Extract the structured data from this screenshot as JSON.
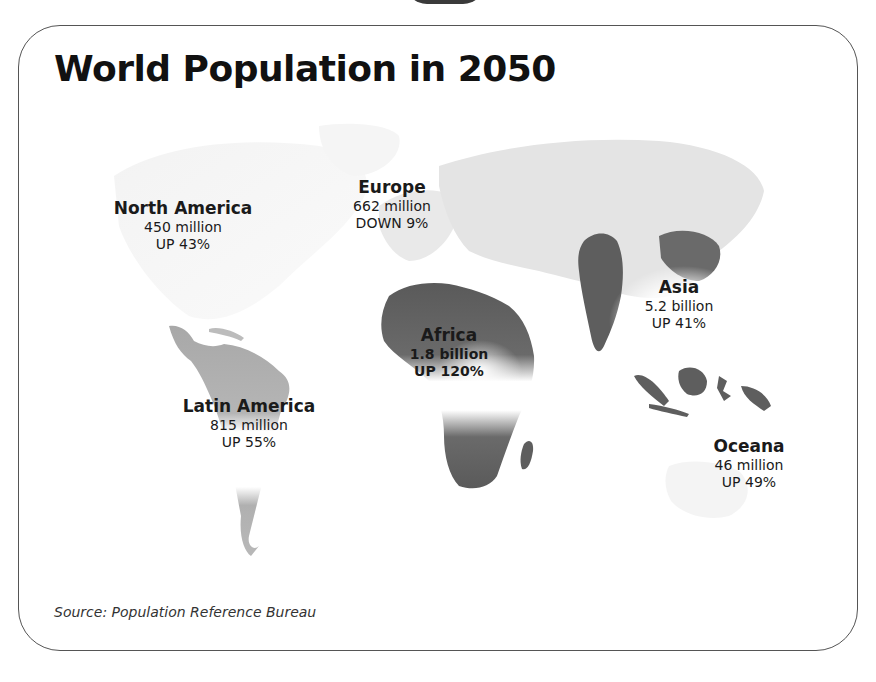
{
  "title": "World Population in 2050",
  "source": "Source: Population Reference Bureau",
  "regions": [
    {
      "name": "North America",
      "population": "450 million",
      "change": "UP 43%"
    },
    {
      "name": "Europe",
      "population": "662 million",
      "change": "DOWN 9%"
    },
    {
      "name": "Asia",
      "population": "5.2 billion",
      "change": "UP 41%"
    },
    {
      "name": "Africa",
      "population": "1.8 billion",
      "change": "UP 120%"
    },
    {
      "name": "Latin America",
      "population": "815 million",
      "change": "UP 55%"
    },
    {
      "name": "Oceana",
      "population": "46 million",
      "change": "UP 49%"
    }
  ],
  "colors": {
    "light_land": "#e4e4e4",
    "mid_land": "#b0b0b0",
    "dark_land": "#5e5e5e",
    "border": "#555555"
  }
}
